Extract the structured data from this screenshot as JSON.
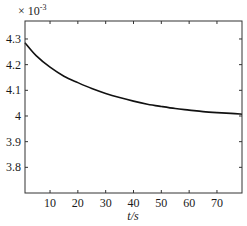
{
  "chart_data": {
    "type": "line",
    "title": "",
    "xlabel": "t/s",
    "ylabel": "",
    "y_multiplier_label": "× 10^-3",
    "y_multiplier_base": "× 10",
    "y_multiplier_exp": "-3",
    "xlim": [
      1,
      79
    ],
    "ylim": [
      3.7,
      4.37
    ],
    "grid": false,
    "legend": null,
    "x_ticks": [
      10,
      20,
      30,
      40,
      50,
      60,
      70
    ],
    "x_tick_labels": [
      "10",
      "20",
      "30",
      "40",
      "50",
      "60",
      "70"
    ],
    "y_ticks": [
      3.8,
      3.9,
      4.0,
      4.1,
      4.2,
      4.3
    ],
    "y_tick_labels": [
      "3.8",
      "3.9",
      "4",
      "4.1",
      "4.2",
      "4.3"
    ],
    "series": [
      {
        "name": "curve",
        "color": "#111111",
        "x": [
          1,
          5,
          10,
          15,
          20,
          25,
          30,
          35,
          40,
          45,
          50,
          55,
          60,
          65,
          70,
          75,
          79
        ],
        "y": [
          4.285,
          4.235,
          4.19,
          4.155,
          4.13,
          4.107,
          4.088,
          4.072,
          4.058,
          4.046,
          4.037,
          4.029,
          4.023,
          4.017,
          4.013,
          4.01,
          4.007
        ]
      }
    ]
  }
}
